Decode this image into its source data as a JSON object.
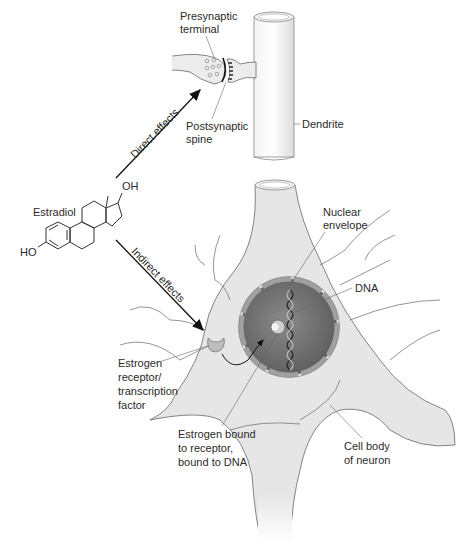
{
  "figure": {
    "molecule": {
      "name": "Estradiol",
      "oh_top": "OH",
      "oh_left": "HO"
    },
    "arrows": {
      "direct": "Direct effects",
      "indirect": "Indirect effects"
    },
    "synapse_labels": {
      "presynaptic": [
        "Presynaptic",
        "terminal"
      ],
      "postsynaptic": [
        "Postsynaptic",
        "spine"
      ],
      "dendrite": "Dendrite"
    },
    "neuron_labels": {
      "nuclear_envelope": [
        "Nuclear",
        "envelope"
      ],
      "dna": "DNA",
      "receptor": [
        "Estrogen",
        "receptor/",
        "transcription",
        "factor"
      ],
      "bound": [
        "Estrogen bound",
        "to receptor,",
        "bound to DNA"
      ],
      "cell_body": [
        "Cell body",
        "of neuron"
      ]
    },
    "colors": {
      "cell_fill": "#e6e6e6",
      "nucleus_fill": "#6e6e6e",
      "envelope": "#9a9a9a",
      "line": "#333333",
      "arrow": "#111111"
    }
  }
}
